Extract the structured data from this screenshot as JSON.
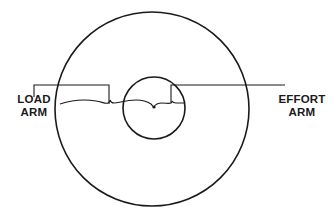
{
  "diagram": {
    "labels": {
      "load_arm": {
        "line1": "LOAD",
        "line2": "ARM"
      },
      "effort_arm": {
        "line1": "EFFORT",
        "line2": "ARM"
      }
    },
    "colors": {
      "stroke": "#1a1a1a",
      "background": "#ffffff"
    },
    "elements": {
      "wheel": {
        "cx": 152,
        "cy": 109,
        "r": 97
      },
      "axle": {
        "cx": 154,
        "cy": 108,
        "r": 31
      },
      "center_point": {
        "cx": 154,
        "cy": 107
      }
    }
  }
}
